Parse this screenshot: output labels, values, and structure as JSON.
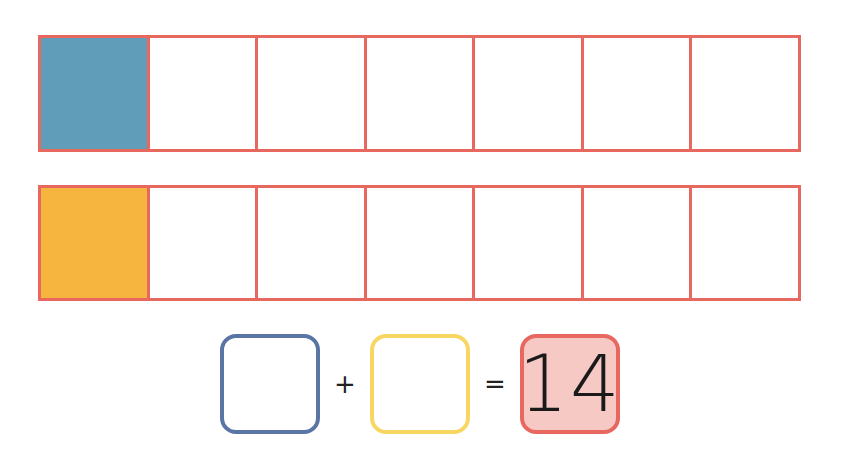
{
  "worksheet": {
    "frames": [
      {
        "name": "blue-row",
        "cells_total": 7,
        "filled_cells": 1,
        "fill_color": "#5f9db8",
        "border_color": "#e8675f"
      },
      {
        "name": "yellow-row",
        "cells_total": 7,
        "filled_cells": 1,
        "fill_color": "#f6b53f",
        "border_color": "#e8675f"
      }
    ],
    "equation": {
      "addend_1": "",
      "addend_2": "",
      "plus_sign": "+",
      "equals_sign": "=",
      "sum": "14",
      "addend_1_color": "#5b74a6",
      "addend_2_color": "#f7d762",
      "sum_border_color": "#e8675f",
      "sum_fill_color": "#f6c9c4"
    }
  }
}
